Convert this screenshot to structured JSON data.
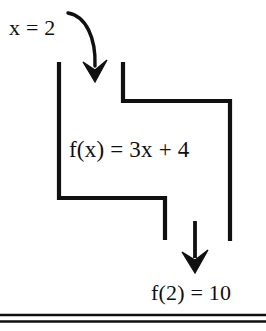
{
  "document": {
    "type": "function-machine-diagram",
    "background_color": "#ffffff",
    "ink_color": "#101010"
  },
  "diagram": {
    "input_label": "x = 2",
    "rule_label": "f(x) = 3x + 4",
    "output_label": "f(2) = 10",
    "arrows": [
      {
        "name": "input-curved-arrow",
        "shape": "curved",
        "direction": "down",
        "from": [
          68,
          13
        ],
        "to": [
          95,
          82
        ]
      },
      {
        "name": "output-straight-arrow",
        "shape": "straight",
        "direction": "down",
        "from": [
          195,
          221
        ],
        "to": [
          195,
          273
        ]
      }
    ],
    "channel_paths": [
      {
        "name": "left-channel",
        "points": [
          [
            59,
            62
          ],
          [
            59,
            198
          ],
          [
            165,
            198
          ],
          [
            165,
            240
          ]
        ]
      },
      {
        "name": "right-channel",
        "points": [
          [
            123,
            62
          ],
          [
            123,
            101
          ],
          [
            230,
            101
          ],
          [
            230,
            241
          ]
        ]
      }
    ],
    "rules": [
      {
        "name": "page-rule-upper",
        "y": 315
      },
      {
        "name": "page-rule-lower",
        "y": 321
      }
    ]
  }
}
